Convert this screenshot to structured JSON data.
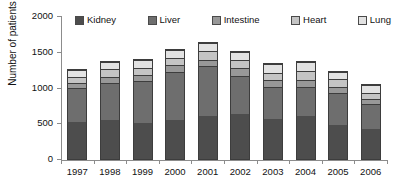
{
  "chart_data": {
    "type": "bar",
    "stacked": true,
    "title": "",
    "xlabel": "",
    "ylabel": "Number of patients",
    "ylim": [
      0,
      2000
    ],
    "yticks": [
      0,
      500,
      1000,
      1500,
      2000
    ],
    "ytick_labels": [
      "0",
      "500",
      "1000",
      "1500",
      "2000"
    ],
    "grid": false,
    "legend_position": "top",
    "categories": [
      "1997",
      "1998",
      "1999",
      "2000",
      "2001",
      "2002",
      "2003",
      "2004",
      "2005",
      "2006"
    ],
    "series": [
      {
        "name": "Kidney",
        "color": "#4d4d4d",
        "values": [
          525,
          555,
          515,
          560,
          615,
          645,
          570,
          615,
          490,
          425
        ]
      },
      {
        "name": "Liver",
        "color": "#6e6e6e",
        "values": [
          485,
          535,
          600,
          685,
          705,
          545,
          465,
          415,
          460,
          360
        ]
      },
      {
        "name": "Intestine",
        "color": "#989898",
        "values": [
          80,
          85,
          85,
          90,
          95,
          100,
          90,
          95,
          85,
          75
        ]
      },
      {
        "name": "Heart",
        "color": "#c4c4c4",
        "values": [
          90,
          105,
          100,
          110,
          125,
          115,
          110,
          130,
          105,
          95
        ]
      },
      {
        "name": "Lung",
        "color": "#e2e2e2",
        "values": [
          90,
          110,
          110,
          110,
          110,
          120,
          120,
          130,
          100,
          105
        ]
      }
    ],
    "totals": [
      1270,
      1390,
      1410,
      1555,
      1650,
      1525,
      1355,
      1385,
      1240,
      1060
    ]
  }
}
